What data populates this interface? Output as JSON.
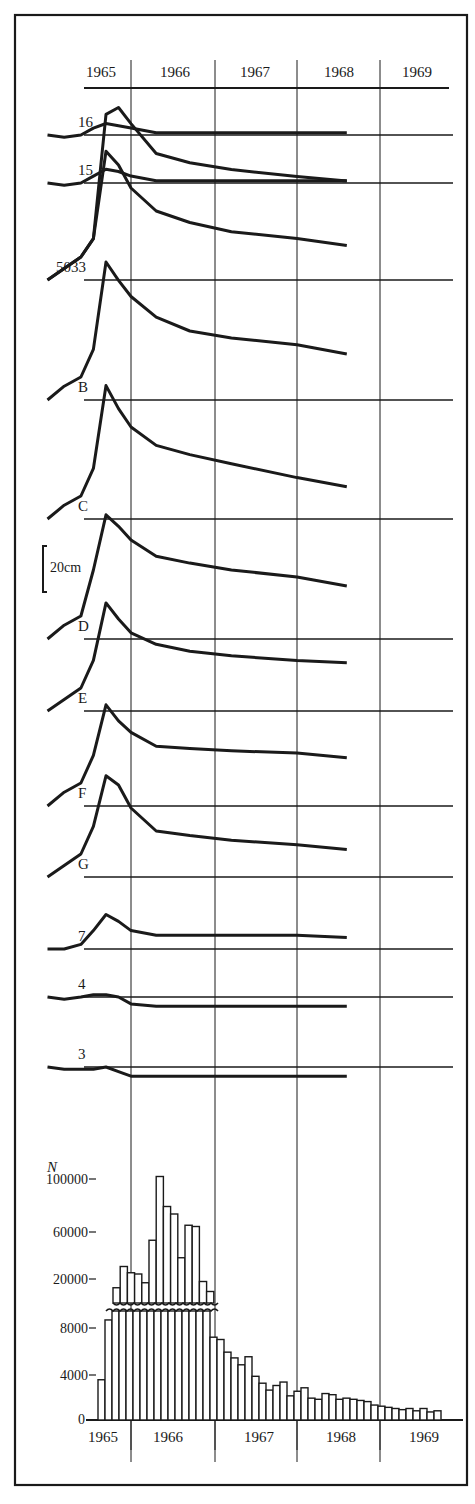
{
  "colors": {
    "ink": "#1a1a1a",
    "background": "#ffffff"
  },
  "header": {
    "years": [
      "1965",
      "1966",
      "1967",
      "1968",
      "1969"
    ]
  },
  "scale_bar": {
    "label": "20cm"
  },
  "chart_data": [
    {
      "type": "line",
      "title": "",
      "xlabel": "Year",
      "ylabel": "Relative displacement (scale bar = 20 cm)",
      "x_ticks": [
        "1965",
        "1966",
        "1967",
        "1968",
        "1969"
      ],
      "x": [
        1965.0,
        1965.2,
        1965.4,
        1965.55,
        1965.7,
        1965.85,
        1966.0,
        1966.3,
        1966.7,
        1967.2,
        1968.0,
        1968.6
      ],
      "units": "cm (approx., read from 20 cm scale bar)",
      "series": [
        {
          "name": "16",
          "baseline_y": 135,
          "values": [
            0,
            -1,
            0,
            3,
            5,
            4,
            3,
            1,
            1,
            1,
            1,
            1
          ]
        },
        {
          "name": "15",
          "baseline_y": 183,
          "values": [
            0,
            -1,
            0,
            3,
            6,
            5,
            3,
            1,
            1,
            1,
            1,
            1
          ]
        },
        {
          "name": "5033 (upper)",
          "baseline_y": 280,
          "values": [
            0,
            5,
            10,
            18,
            72,
            75,
            68,
            55,
            51,
            48,
            45,
            43
          ]
        },
        {
          "name": "5033",
          "baseline_y": 280,
          "values": [
            0,
            5,
            10,
            18,
            56,
            50,
            40,
            30,
            25,
            21,
            18,
            15
          ]
        },
        {
          "name": "B",
          "baseline_y": 400,
          "values": [
            0,
            6,
            10,
            22,
            60,
            52,
            45,
            36,
            30,
            27,
            24,
            20
          ]
        },
        {
          "name": "C",
          "baseline_y": 519,
          "values": [
            0,
            6,
            10,
            22,
            58,
            48,
            40,
            32,
            28,
            24,
            18,
            14
          ]
        },
        {
          "name": "D",
          "baseline_y": 639,
          "values": [
            0,
            6,
            10,
            30,
            54,
            49,
            43,
            36,
            33,
            30,
            27,
            23
          ]
        },
        {
          "name": "E",
          "baseline_y": 711,
          "values": [
            0,
            5,
            10,
            22,
            47,
            40,
            34,
            29,
            26,
            24,
            22,
            21
          ]
        },
        {
          "name": "F",
          "baseline_y": 806,
          "values": [
            0,
            6,
            10,
            22,
            44,
            37,
            32,
            26,
            25,
            24,
            23,
            21
          ]
        },
        {
          "name": "G",
          "baseline_y": 877,
          "values": [
            0,
            5,
            10,
            22,
            44,
            40,
            30,
            20,
            18,
            16,
            14,
            12
          ]
        },
        {
          "name": "7",
          "baseline_y": 949,
          "values": [
            0,
            0,
            2,
            8,
            15,
            12,
            8,
            6,
            6,
            6,
            6,
            5
          ]
        },
        {
          "name": "4",
          "baseline_y": 997,
          "values": [
            0,
            -1,
            0,
            1,
            1,
            0,
            -3,
            -4,
            -4,
            -4,
            -4,
            -4
          ]
        },
        {
          "name": "3",
          "baseline_y": 1067,
          "values": [
            0,
            -1,
            -1,
            -1,
            0,
            -2,
            -4,
            -4,
            -4,
            -4,
            -4,
            -4
          ]
        }
      ],
      "grid": true
    },
    {
      "type": "bar",
      "title": "",
      "xlabel": "",
      "ylabel": "N",
      "x_ticks": [
        "1965",
        "1966",
        "1967",
        "1968",
        "1969"
      ],
      "y_ticks_lower": [
        "0",
        "4000",
        "8000"
      ],
      "y_ticks_upper": [
        "20000",
        "60000",
        "100000"
      ],
      "axis_break": "between 8000-scale lower panel and 20000+ upper panel",
      "bin": "monthly (approx.)",
      "upper_values": [
        13000,
        30000,
        25000,
        24000,
        17000,
        51000,
        102000,
        78000,
        72000,
        37000,
        63000,
        62000,
        18000,
        10000
      ],
      "lower_values": [
        3500,
        8700,
        9500,
        9500,
        9500,
        9500,
        9500,
        9500,
        9500,
        9500,
        9500,
        9500,
        9500,
        9500,
        9500,
        9500,
        7200,
        7000,
        5900,
        5400,
        4800,
        5500,
        3800,
        3200,
        2600,
        3000,
        3300,
        2100,
        2500,
        2800,
        1900,
        1800,
        2300,
        2200,
        1800,
        1900,
        1800,
        1700,
        1600,
        1300,
        1200,
        1100,
        1000,
        900,
        1000,
        800,
        1000,
        700,
        800
      ]
    }
  ]
}
